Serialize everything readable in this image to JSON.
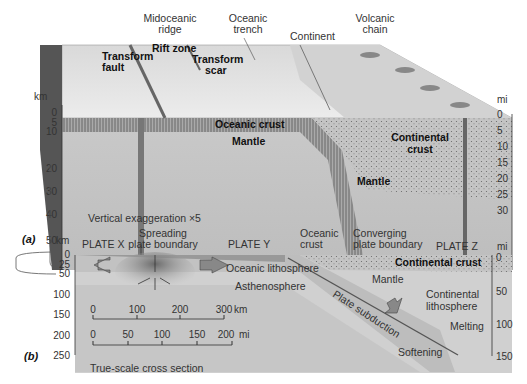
{
  "panel_a": {
    "id": "(a)",
    "top_labels": {
      "midoceanic_ridge": [
        "Midoceanic",
        "ridge"
      ],
      "oceanic_trench": [
        "Oceanic",
        "trench"
      ],
      "continent": "Continent",
      "volcanic_chain": [
        "Volcanic",
        "chain"
      ],
      "rift_zone": "Rift zone",
      "transform_fault": [
        "Transform",
        "fault"
      ],
      "transform_scar": [
        "Transform",
        "scar"
      ]
    },
    "inner_labels": {
      "oceanic_crust": "Oceanic crust",
      "mantle_left": "Mantle",
      "continental_crust": [
        "Continental",
        "crust"
      ],
      "mantle_right": "Mantle"
    },
    "left_axis": {
      "unit": "km",
      "ticks": [
        "0",
        "5",
        "10",
        "20",
        "30",
        "40",
        "50"
      ]
    },
    "right_axis": {
      "unit": "mi",
      "ticks": [
        "0",
        "5",
        "10",
        "15",
        "20",
        "25",
        "30"
      ]
    },
    "caption": "Vertical exaggeration ×5"
  },
  "panel_b": {
    "id": "(b)",
    "top_labels": {
      "plate_x": "PLATE X",
      "spreading": [
        "Spreading",
        "plate boundary"
      ],
      "plate_y": "PLATE Y",
      "oceanic_crust": [
        "Oceanic",
        "crust"
      ],
      "converging": [
        "Converging",
        "plate boundary"
      ],
      "plate_z": "PLATE Z"
    },
    "inner_labels": {
      "oceanic_lithosphere": "Oceanic lithosphere",
      "asthenosphere": "Asthenosphere",
      "continental_crust": "Continental crust",
      "mantle": "Mantle",
      "continental_lithosphere": [
        "Continental",
        "lithosphere"
      ],
      "plate_subduction": "Plate subduction",
      "melting": "Melting",
      "softening": "Softening"
    },
    "left_axis": {
      "unit": "km",
      "ticks": [
        "0",
        "25",
        "50",
        "100",
        "150",
        "200",
        "250"
      ]
    },
    "right_axis": {
      "unit": "mi",
      "ticks": [
        "0",
        "50",
        "100",
        "150"
      ]
    },
    "scale_km": {
      "ticks": [
        "0",
        "100",
        "200",
        "300"
      ],
      "unit": "km"
    },
    "scale_mi": {
      "ticks": [
        "0",
        "50",
        "100",
        "150",
        "200"
      ],
      "unit": "mi"
    },
    "caption": "True-scale cross section"
  }
}
